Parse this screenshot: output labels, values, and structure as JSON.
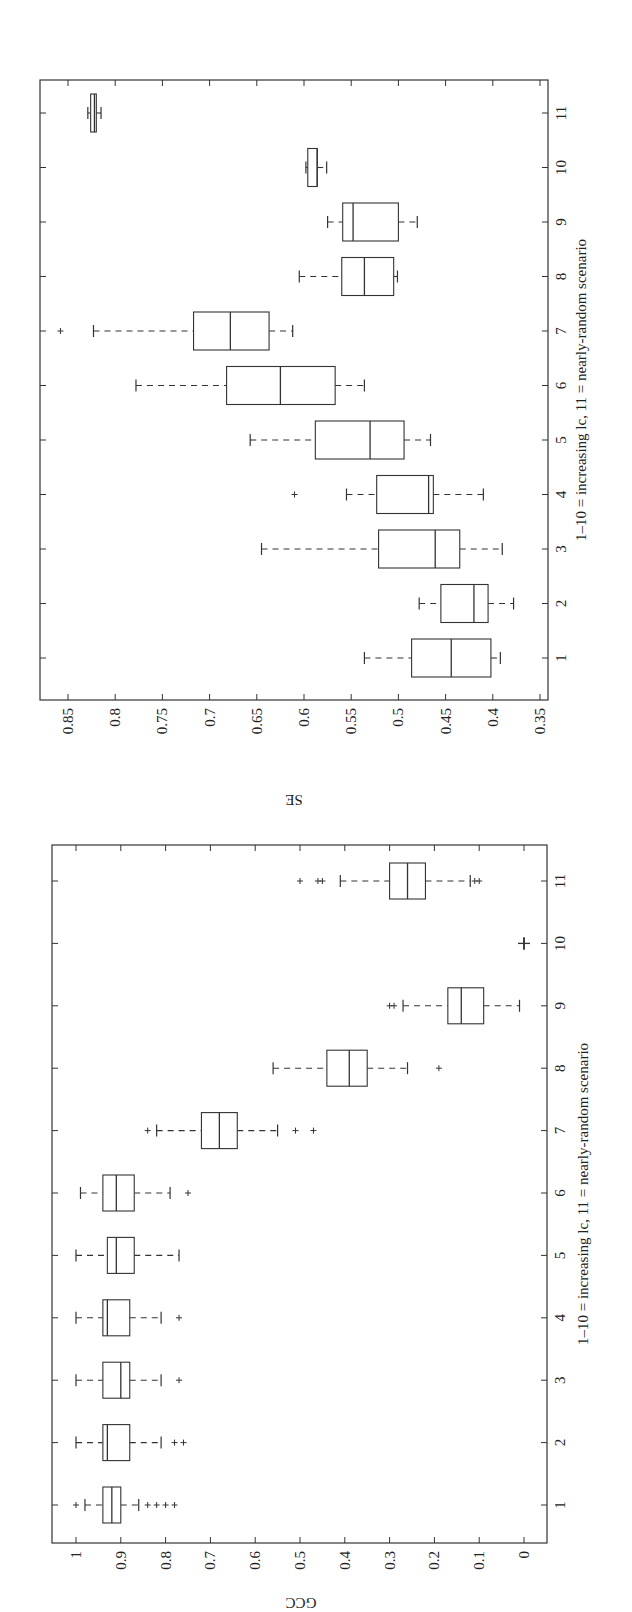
{
  "chart_data": [
    {
      "type": "box",
      "orientation": "rotated-90-clockwise",
      "title": "",
      "xlabel": "1–10 = increasing lc, 11 = nearly-random scenario",
      "ylabel": "SE",
      "ylim": [
        0.35,
        0.88
      ],
      "yticks": [
        "0.35",
        "0.4",
        "0.45",
        "0.5",
        "0.55",
        "0.6",
        "0.65",
        "0.7",
        "0.75",
        "0.8",
        "0.85"
      ],
      "categories": [
        "1",
        "2",
        "3",
        "4",
        "5",
        "6",
        "7",
        "8",
        "9",
        "10",
        "11"
      ],
      "grid": false,
      "boxes": [
        {
          "cat": "1",
          "whisker_low": 0.392,
          "q1": 0.402,
          "median": 0.444,
          "q3": 0.486,
          "whisker_high": 0.536,
          "outliers": []
        },
        {
          "cat": "2",
          "whisker_low": 0.378,
          "q1": 0.405,
          "median": 0.42,
          "q3": 0.455,
          "whisker_high": 0.478,
          "outliers": []
        },
        {
          "cat": "3",
          "whisker_low": 0.39,
          "q1": 0.435,
          "median": 0.461,
          "q3": 0.521,
          "whisker_high": 0.645,
          "outliers": []
        },
        {
          "cat": "4",
          "whisker_low": 0.41,
          "q1": 0.463,
          "median": 0.468,
          "q3": 0.523,
          "whisker_high": 0.555,
          "outliers": [
            0.61
          ]
        },
        {
          "cat": "5",
          "whisker_low": 0.466,
          "q1": 0.494,
          "median": 0.53,
          "q3": 0.588,
          "whisker_high": 0.657,
          "outliers": []
        },
        {
          "cat": "6",
          "whisker_low": 0.536,
          "q1": 0.567,
          "median": 0.625,
          "q3": 0.682,
          "whisker_high": 0.778,
          "outliers": []
        },
        {
          "cat": "7",
          "whisker_low": 0.612,
          "q1": 0.637,
          "median": 0.678,
          "q3": 0.717,
          "whisker_high": 0.823,
          "outliers": [
            0.858
          ]
        },
        {
          "cat": "8",
          "whisker_low": 0.501,
          "q1": 0.505,
          "median": 0.536,
          "q3": 0.56,
          "whisker_high": 0.605,
          "outliers": []
        },
        {
          "cat": "9",
          "whisker_low": 0.48,
          "q1": 0.5,
          "median": 0.548,
          "q3": 0.559,
          "whisker_high": 0.575,
          "outliers": []
        },
        {
          "cat": "10",
          "whisker_low": 0.576,
          "q1": 0.586,
          "median": 0.586,
          "q3": 0.596,
          "whisker_high": 0.598,
          "outliers": []
        },
        {
          "cat": "11",
          "whisker_low": 0.815,
          "q1": 0.82,
          "median": 0.822,
          "q3": 0.826,
          "whisker_high": 0.829,
          "outliers": []
        }
      ]
    },
    {
      "type": "box",
      "orientation": "rotated-90-clockwise",
      "title": "",
      "xlabel": "1–10 = increasing lc, 11 = nearly-random scenario",
      "ylabel": "GCC",
      "ylim": [
        -0.05,
        1.05
      ],
      "yticks": [
        "0",
        "0.1",
        "0.2",
        "0.3",
        "0.4",
        "0.5",
        "0.6",
        "0.7",
        "0.8",
        "0.9",
        "1"
      ],
      "categories": [
        "1",
        "2",
        "3",
        "4",
        "5",
        "6",
        "7",
        "8",
        "9",
        "10",
        "11"
      ],
      "grid": false,
      "boxes": [
        {
          "cat": "1",
          "whisker_low": 0.86,
          "q1": 0.9,
          "median": 0.92,
          "q3": 0.94,
          "whisker_high": 0.98,
          "outliers": [
            1.0,
            0.84,
            0.82,
            0.8,
            0.78
          ]
        },
        {
          "cat": "2",
          "whisker_low": 0.81,
          "q1": 0.88,
          "median": 0.93,
          "q3": 0.94,
          "whisker_high": 1.0,
          "outliers": [
            0.78,
            0.76
          ]
        },
        {
          "cat": "3",
          "whisker_low": 0.81,
          "q1": 0.88,
          "median": 0.9,
          "q3": 0.94,
          "whisker_high": 1.0,
          "outliers": [
            0.77
          ]
        },
        {
          "cat": "4",
          "whisker_low": 0.81,
          "q1": 0.88,
          "median": 0.93,
          "q3": 0.94,
          "whisker_high": 1.0,
          "outliers": [
            0.77
          ]
        },
        {
          "cat": "5",
          "whisker_low": 0.77,
          "q1": 0.87,
          "median": 0.91,
          "q3": 0.93,
          "whisker_high": 1.0,
          "outliers": []
        },
        {
          "cat": "6",
          "whisker_low": 0.79,
          "q1": 0.87,
          "median": 0.91,
          "q3": 0.94,
          "whisker_high": 0.99,
          "outliers": [
            0.75
          ]
        },
        {
          "cat": "7",
          "whisker_low": 0.55,
          "q1": 0.64,
          "median": 0.68,
          "q3": 0.72,
          "whisker_high": 0.82,
          "outliers": [
            0.84,
            0.51,
            0.47
          ]
        },
        {
          "cat": "8",
          "whisker_low": 0.26,
          "q1": 0.35,
          "median": 0.39,
          "q3": 0.44,
          "whisker_high": 0.56,
          "outliers": [
            0.19
          ]
        },
        {
          "cat": "9",
          "whisker_low": 0.01,
          "q1": 0.09,
          "median": 0.14,
          "q3": 0.17,
          "whisker_high": 0.27,
          "outliers": [
            0.29,
            0.3
          ]
        },
        {
          "cat": "10",
          "whisker_low": 0.0,
          "q1": 0.0,
          "median": 0.0,
          "q3": 0.0,
          "whisker_high": 0.0,
          "outliers": []
        },
        {
          "cat": "11",
          "whisker_low": 0.12,
          "q1": 0.22,
          "median": 0.26,
          "q3": 0.3,
          "whisker_high": 0.41,
          "outliers": [
            0.11,
            0.1,
            0.45,
            0.46,
            0.5
          ]
        }
      ]
    }
  ],
  "labels": {
    "se_axis": "SE",
    "gcc_axis": "GCC",
    "category_axis": "1–10 = increasing lc, 11 = nearly-random scenario"
  },
  "colors": {
    "ink": "#333333",
    "background": "#ffffff"
  }
}
